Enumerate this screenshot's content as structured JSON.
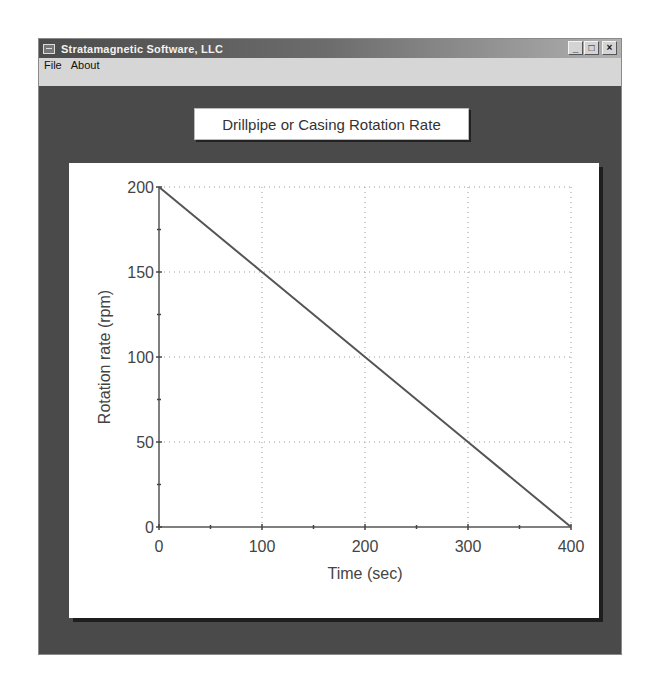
{
  "window": {
    "title": "Stratamagnetic Software, LLC",
    "icon": "app-window-icon",
    "controls": {
      "minimize": "_",
      "maximize": "□",
      "close": "×"
    }
  },
  "menubar": {
    "items": [
      {
        "label": "File"
      },
      {
        "label": "About"
      }
    ]
  },
  "chart_title": "Drillpipe or Casing Rotation Rate",
  "chart_data": {
    "type": "line",
    "title": "Drillpipe or Casing Rotation Rate",
    "xlabel": "Time (sec)",
    "ylabel": "Rotation rate (rpm)",
    "xlim": [
      0,
      400
    ],
    "ylim": [
      0,
      200
    ],
    "x_ticks": [
      0,
      100,
      200,
      300,
      400
    ],
    "y_ticks": [
      0,
      50,
      100,
      150,
      200
    ],
    "x_tick_labels": [
      "0",
      "100",
      "200",
      "300",
      "400"
    ],
    "y_tick_labels": [
      "0",
      "50",
      "100",
      "150",
      "200"
    ],
    "x_minor_ticks": [
      50,
      150,
      250,
      350
    ],
    "y_minor_ticks": [
      25,
      75,
      125,
      175
    ],
    "grid": true,
    "grid_style": "dotted",
    "legend": null,
    "series": [
      {
        "name": "Rotation rate",
        "x": [
          0,
          100,
          200,
          300,
          400
        ],
        "y": [
          200,
          150,
          100,
          50,
          0
        ],
        "color": "#555555"
      }
    ]
  }
}
